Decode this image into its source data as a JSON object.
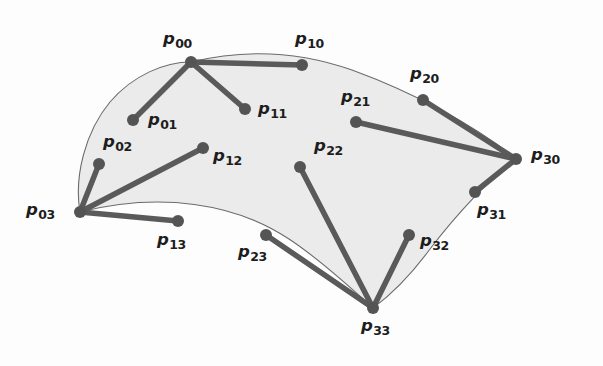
{
  "figure": {
    "background_color": "#fdfdfd",
    "surface_fill_color": "#ebebeb",
    "surface_outline_color": "#6b6b6b",
    "control_leg_color": "#5a5a5a",
    "control_point_color": "#545454",
    "label_color": "#1d1d1d"
  },
  "control_points": [
    {
      "id": "p00",
      "base": "p",
      "sub": "00",
      "x": 191,
      "y": 62,
      "label_x": 163,
      "label_y": 31,
      "corner": true
    },
    {
      "id": "p10",
      "base": "p",
      "sub": "10",
      "x": 302,
      "y": 65,
      "label_x": 295,
      "label_y": 31,
      "corner": false
    },
    {
      "id": "p20",
      "base": "p",
      "sub": "20",
      "x": 423,
      "y": 100,
      "label_x": 410,
      "label_y": 66,
      "corner": false
    },
    {
      "id": "p30",
      "base": "p",
      "sub": "30",
      "x": 516,
      "y": 159,
      "label_x": 531,
      "label_y": 147,
      "corner": true
    },
    {
      "id": "p01",
      "base": "p",
      "sub": "01",
      "x": 133,
      "y": 120,
      "label_x": 148,
      "label_y": 112,
      "corner": false
    },
    {
      "id": "p11",
      "base": "p",
      "sub": "11",
      "x": 245,
      "y": 109,
      "label_x": 258,
      "label_y": 101,
      "corner": false
    },
    {
      "id": "p21",
      "base": "p",
      "sub": "21",
      "x": 356,
      "y": 122,
      "label_x": 341,
      "label_y": 89,
      "corner": false
    },
    {
      "id": "p31",
      "base": "p",
      "sub": "31",
      "x": 475,
      "y": 192,
      "label_x": 477,
      "label_y": 202,
      "corner": false
    },
    {
      "id": "p02",
      "base": "p",
      "sub": "02",
      "x": 99,
      "y": 164,
      "label_x": 103,
      "label_y": 134,
      "corner": false
    },
    {
      "id": "p12",
      "base": "p",
      "sub": "12",
      "x": 203,
      "y": 148,
      "label_x": 213,
      "label_y": 148,
      "corner": false
    },
    {
      "id": "p22",
      "base": "p",
      "sub": "22",
      "x": 300,
      "y": 167,
      "label_x": 314,
      "label_y": 138,
      "corner": false
    },
    {
      "id": "p32",
      "base": "p",
      "sub": "32",
      "x": 409,
      "y": 235,
      "label_x": 420,
      "label_y": 233,
      "corner": false
    },
    {
      "id": "p03",
      "base": "p",
      "sub": "03",
      "x": 80,
      "y": 212,
      "label_x": 26,
      "label_y": 202,
      "corner": true
    },
    {
      "id": "p13",
      "base": "p",
      "sub": "13",
      "x": 178,
      "y": 221,
      "label_x": 157,
      "label_y": 232,
      "corner": false
    },
    {
      "id": "p23",
      "base": "p",
      "sub": "23",
      "x": 266,
      "y": 235,
      "label_x": 238,
      "label_y": 244,
      "corner": false
    },
    {
      "id": "p33",
      "base": "p",
      "sub": "33",
      "x": 373,
      "y": 308,
      "label_x": 361,
      "label_y": 318,
      "corner": true
    }
  ],
  "control_legs": [
    {
      "id": "leg-p00-p10",
      "from": "p00",
      "to": "p10"
    },
    {
      "id": "leg-p00-p01",
      "from": "p00",
      "to": "p01"
    },
    {
      "id": "leg-p00-p11",
      "from": "p00",
      "to": "p11"
    },
    {
      "id": "leg-p30-p20",
      "from": "p30",
      "to": "p20"
    },
    {
      "id": "leg-p30-p21",
      "from": "p30",
      "to": "p21"
    },
    {
      "id": "leg-p30-p31",
      "from": "p30",
      "to": "p31"
    },
    {
      "id": "leg-p03-p02",
      "from": "p03",
      "to": "p02"
    },
    {
      "id": "leg-p03-p12",
      "from": "p03",
      "to": "p12"
    },
    {
      "id": "leg-p03-p13",
      "from": "p03",
      "to": "p13"
    },
    {
      "id": "leg-p33-p23",
      "from": "p33",
      "to": "p23"
    },
    {
      "id": "leg-p33-p22",
      "from": "p33",
      "to": "p22"
    },
    {
      "id": "leg-p33-p32",
      "from": "p33",
      "to": "p32"
    }
  ],
  "surface_boundary": {
    "description": "Four cubic Bezier boundary curves of the patch",
    "path": "M 191 62 C 240 50 295 50 352 70 C 415 93 478 127 516 159 C 492 176 456 215 430 249 C 408 279 388 297 373 308 C 349 286 318 258 289 239 C 235 203 160 192 80 212 C 74 177 85 132 110 102 C 133 75 165 62 191 62 Z",
    "top_curve": "M 191 62 C 240 50 295 50 352 70 C 415 93 478 127 516 159",
    "right_curve": "M 516 159 C 492 176 456 215 430 249 C 408 279 388 297 373 308",
    "bottom_curve": "M 373 308 C 349 286 318 258 289 239 C 235 203 160 192 80 212",
    "left_curve": "M 80 212 C 74 177 85 132 110 102 C 133 75 165 62 191 62"
  },
  "geometry": {
    "point_radius": 6,
    "leg_stroke_width": 5.5,
    "outline_stroke_width": 1.1
  }
}
